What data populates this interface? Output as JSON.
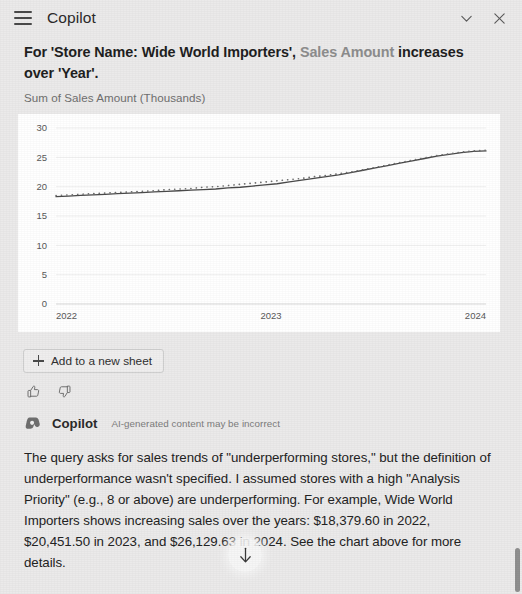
{
  "header": {
    "title": "Copilot",
    "menu_icon": "hamburger-menu-icon",
    "collapse_icon": "chevron-down-icon",
    "close_icon": "close-icon"
  },
  "insight": {
    "title_part1": "For 'Store Name: Wide World Importers', ",
    "title_measure": "Sales Amount",
    "title_part2": " increases over 'Year'.",
    "chart_subtitle": "Sum of Sales Amount (Thousands)"
  },
  "actions": {
    "add_to_sheet_label": "Add to a new sheet",
    "add_icon": "plus-icon",
    "thumbs_up_icon": "thumbs-up-icon",
    "thumbs_down_icon": "thumbs-down-icon"
  },
  "attribution": {
    "logo": "copilot-logo-icon",
    "name": "Copilot",
    "disclaimer": "AI-generated content may be incorrect"
  },
  "answer": {
    "text": "The query asks for sales trends of \"underperforming stores,\" but the definition of underperformance wasn't specified. I assumed stores with a high \"Analysis Priority\" (e.g., 8 or above) are underperforming. For example, Wide World Importers shows increasing sales over the years: $18,379.60 in 2022, $20,451.50 in 2023, and $26,129.63 in 2024. See the chart above for more details."
  },
  "scroll_down": {
    "icon": "arrow-down-icon"
  },
  "chart_data": {
    "type": "line",
    "title": "",
    "subtitle": "Sum of Sales Amount (Thousands)",
    "xlabel": "Year",
    "ylabel": "",
    "grid": true,
    "legend": "none",
    "ylim": [
      0,
      30
    ],
    "yticks": [
      0,
      5,
      10,
      15,
      20,
      25,
      30
    ],
    "xticks": [
      "2022",
      "2023",
      "2024"
    ],
    "xlim": [
      "2022",
      "2024"
    ],
    "x": [
      "2022-01",
      "2022-02",
      "2022-03",
      "2022-04",
      "2022-05",
      "2022-06",
      "2022-07",
      "2022-08",
      "2022-09",
      "2022-10",
      "2022-11",
      "2022-12",
      "2023-01",
      "2023-02",
      "2023-03",
      "2023-04",
      "2023-05",
      "2023-06",
      "2023-07",
      "2023-08",
      "2023-09",
      "2023-10",
      "2023-11",
      "2023-12",
      "2024-01",
      "2024-02",
      "2024-03",
      "2024-04",
      "2024-05",
      "2024-06",
      "2024-07",
      "2024-08",
      "2024-09",
      "2024-10",
      "2024-11",
      "2024-12"
    ],
    "series": [
      {
        "name": "Sum of Sales Amount",
        "style": "solid",
        "color": "#4a4a4a",
        "values": [
          18.3,
          18.4,
          18.5,
          18.6,
          18.7,
          18.8,
          18.9,
          19.0,
          19.1,
          19.2,
          19.3,
          19.4,
          19.5,
          19.6,
          19.8,
          19.9,
          20.1,
          20.3,
          20.5,
          20.8,
          21.1,
          21.4,
          21.7,
          22.0,
          22.4,
          22.8,
          23.2,
          23.6,
          24.0,
          24.4,
          24.8,
          25.2,
          25.5,
          25.8,
          26.0,
          26.1
        ]
      },
      {
        "name": "Trend",
        "style": "dotted",
        "color": "#6f6f6f",
        "values": [
          18.5,
          18.6,
          18.7,
          18.8,
          18.9,
          19.0,
          19.1,
          19.2,
          19.3,
          19.5,
          19.6,
          19.7,
          19.9,
          20.0,
          20.2,
          20.4,
          20.6,
          20.8,
          21.0,
          21.2,
          21.4,
          21.7,
          21.9,
          22.2,
          22.5,
          22.9,
          23.3,
          23.7,
          24.1,
          24.5,
          24.9,
          25.3,
          25.6,
          25.9,
          26.1,
          26.2
        ]
      }
    ],
    "annotations": {
      "2022_total": "$18,379.60",
      "2023_total": "$20,451.50",
      "2024_total": "$26,129.63"
    }
  },
  "colors": {
    "pane_background": "#ebeaea",
    "card_background": "#ffffff",
    "text_primary": "#232323",
    "text_muted": "#7c7c7c",
    "measure_gray": "#8d8d8d",
    "line_color": "#4a4a4a"
  }
}
